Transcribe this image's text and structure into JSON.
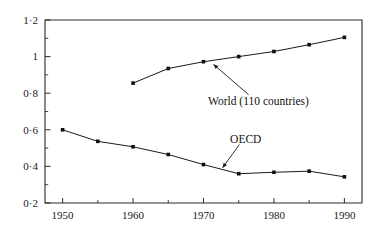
{
  "chart_data": {
    "type": "line",
    "title": "",
    "subtitle": "",
    "xlabel": "",
    "ylabel": "",
    "xlim": [
      1947.5,
      1992.5
    ],
    "ylim": [
      0.2,
      1.2
    ],
    "grid": false,
    "legend_position": "inline-annotations",
    "x_ticks_major": [
      1950,
      1960,
      1970,
      1980,
      1990
    ],
    "x_tick_labels": [
      "1950",
      "1960",
      "1970",
      "1980",
      "1990"
    ],
    "x_ticks_minor": [
      1955,
      1965,
      1975,
      1985
    ],
    "y_ticks_major": [
      0.2,
      0.4,
      0.6,
      0.8,
      1.0,
      1.2
    ],
    "y_tick_labels": [
      "0·2",
      "0·4",
      "0·6",
      "0·8",
      "1",
      "1·2"
    ],
    "y_ticks_minor": [
      0.3,
      0.5,
      0.7,
      0.9,
      1.1
    ],
    "series": [
      {
        "name": "World (110 countries)",
        "x": [
          1960,
          1965,
          1970,
          1975,
          1980,
          1985,
          1990
        ],
        "values": [
          0.855,
          0.935,
          0.972,
          1.0,
          1.028,
          1.065,
          1.105
        ]
      },
      {
        "name": "OECD",
        "x": [
          1950,
          1955,
          1960,
          1965,
          1970,
          1975,
          1980,
          1985,
          1990
        ],
        "values": [
          0.6,
          0.537,
          0.507,
          0.465,
          0.41,
          0.36,
          0.368,
          0.374,
          0.343
        ]
      }
    ],
    "annotations": [
      {
        "text": "World (110 countries)",
        "label_x": 1977.8,
        "label_y": 0.757,
        "leader_from_x": 1976.4,
        "leader_from_y": 0.792,
        "leader_to_x": 1971.4,
        "leader_to_y": 0.958
      },
      {
        "text": "OECD",
        "label_x": 1976.0,
        "label_y": 0.552,
        "leader_from_x": 1975.1,
        "leader_from_y": 0.52,
        "leader_to_x": 1972.7,
        "leader_to_y": 0.392
      }
    ]
  }
}
